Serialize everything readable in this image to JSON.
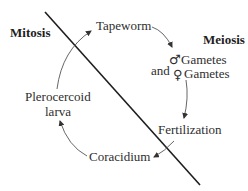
{
  "diagram": {
    "type": "life-cycle",
    "regions": {
      "left": "Mitosis",
      "right": "Meiosis"
    },
    "nodes": {
      "tapeworm": "Tapeworm",
      "and": "and",
      "male_symbol": "♂",
      "female_symbol": "♀",
      "male_gametes": "Gametes",
      "female_gametes": "Gametes",
      "fertilization": "Fertilization",
      "coracidium": "Coracidium",
      "plerocercoid_line1": "Plerocercoid",
      "plerocercoid_line2": "larva"
    },
    "cycle_order": [
      "Tapeworm",
      "♂ Gametes and ♀ Gametes",
      "Fertilization",
      "Coracidium",
      "Plerocercoid larva",
      "Tapeworm"
    ],
    "colors": {
      "text": "#2e2e2e",
      "divider": "#1e1e1e",
      "arrow": "#555555",
      "background": "#ffffff"
    }
  }
}
